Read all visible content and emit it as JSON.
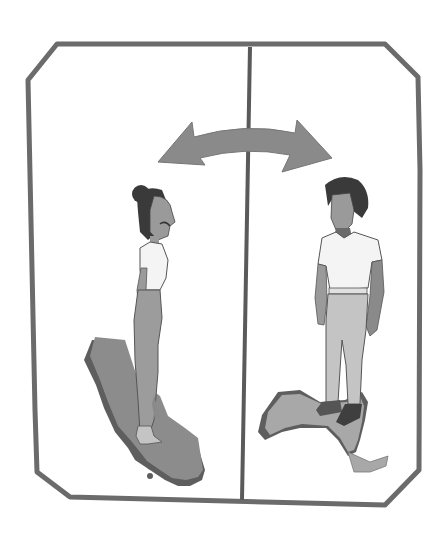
{
  "illustration": {
    "description": "Two figures standing on regional maps, separated by a vertical divider, with a double-headed arrow indicating exchange between them",
    "panels": [
      {
        "side": "left",
        "figure": "woman",
        "map_region": "California"
      },
      {
        "side": "right",
        "figure": "man",
        "map_region": "Caribbean island"
      }
    ],
    "arrow": "double-headed curved arrow"
  },
  "colors": {
    "frame": "#6b6b6b",
    "arrow": "#8a8a8a",
    "map_dark": "#5e5e5e",
    "map_fill": "#8c8c8c",
    "map_light": "#a8a8a8",
    "skin": "#9a9a9a",
    "hair": "#3a3a3a",
    "shirt": "#f4f4f4",
    "pants_left": "#9c9c9c",
    "pants_right": "#c4c4c4",
    "background": "#ffffff"
  }
}
